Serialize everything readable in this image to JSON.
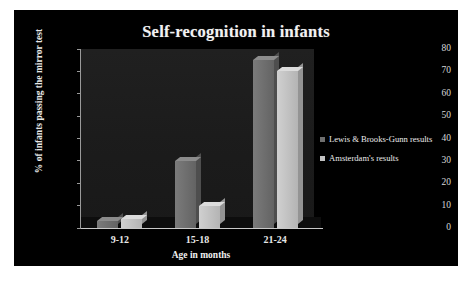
{
  "panel": {
    "background_color": "#000000",
    "page_background": "#ffffff"
  },
  "chart_data": {
    "type": "bar",
    "title": "Self-recognition in infants",
    "xlabel": "Age in months",
    "ylabel": "% of infants passing the mirror test",
    "categories": [
      "9-12",
      "15-18",
      "21-24"
    ],
    "series": [
      {
        "name": "Lewis & Brooks-Gunn results",
        "color": "#6f6f6f",
        "values": [
          3,
          30,
          75
        ]
      },
      {
        "name": "Amsterdam's results",
        "color": "#c2c2c2",
        "values": [
          4,
          10,
          70
        ]
      }
    ],
    "ylim": [
      0,
      80
    ],
    "yticks": [
      0,
      10,
      20,
      30,
      40,
      50,
      60,
      70,
      80
    ],
    "ytick_labels": [
      "0",
      "10",
      "20",
      "30",
      "40",
      "50",
      "60",
      "70",
      "80"
    ],
    "grid": false,
    "legend_position": "right",
    "plot_background": "#1d1d1d",
    "style": "3d-column"
  }
}
